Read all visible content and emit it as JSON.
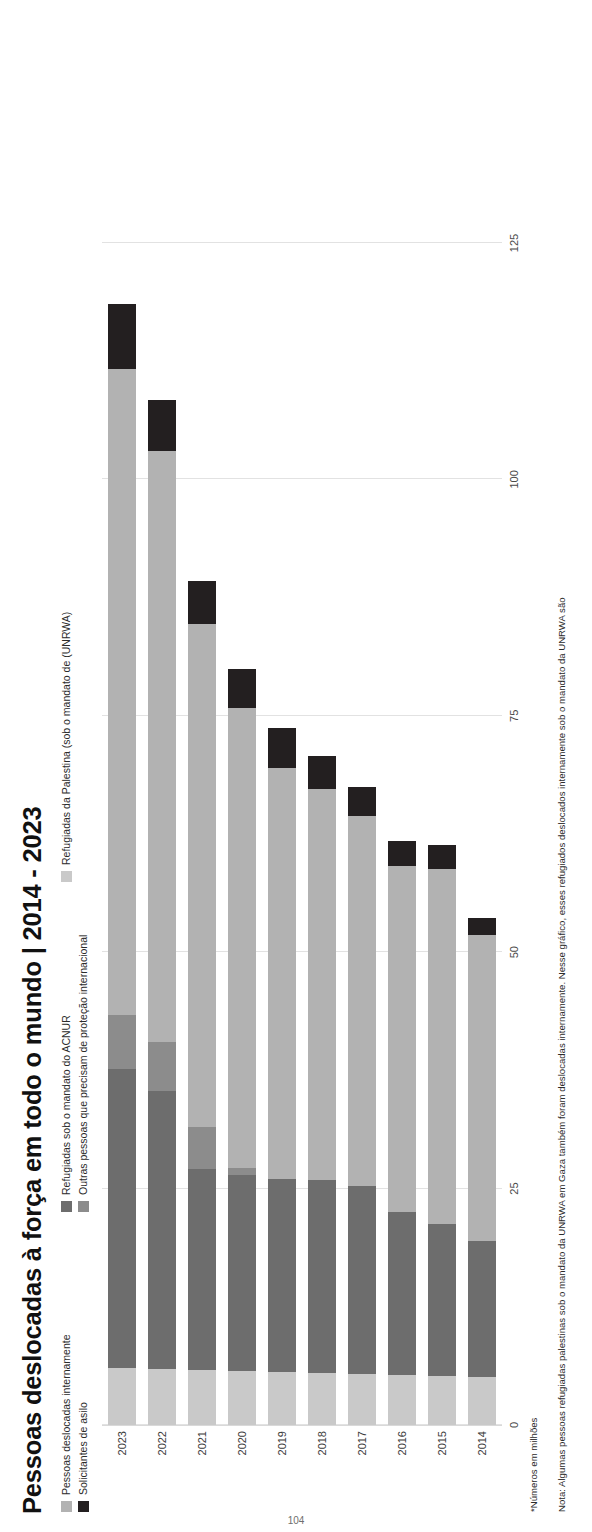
{
  "title": "Pessoas deslocadas à força em todo o mundo | 2014 - 2023",
  "legend": {
    "items": [
      {
        "label": "Pessoas deslocadas internamente",
        "color": "#b2b2b2"
      },
      {
        "label": "Solicitantes de asilo",
        "color": "#231f20"
      },
      {
        "label": "Refugiadas sob o mandato do ACNUR",
        "color": "#6d6d6d"
      },
      {
        "label": "Outras pessoas que precisam de proteção internacional",
        "color": "#8c8c8c"
      },
      {
        "label": "Refugiadas da Palestina (sob o mandato de (UNRWA)",
        "color": "#c9c9c9"
      }
    ]
  },
  "footnotes": {
    "units": "*Números em milhões",
    "note": "Nota: Algumas pessoas refugiadas palestinas sob o mandato da UNRWA em Gaza também foram deslocadas internamente. Nesse gráfico, esses refugiados deslocados internamente sob o mandato da UNRWA são"
  },
  "page_number": "104",
  "chart_data": {
    "type": "bar",
    "orientation": "horizontal-stacked",
    "title": "Pessoas deslocadas à força em todo o mundo | 2014 - 2023",
    "xlabel": "",
    "ylabel": "",
    "units": "milhões",
    "xlim": [
      0,
      125
    ],
    "xticks": [
      0,
      25,
      50,
      75,
      100,
      125
    ],
    "xtick_labels": [
      "0",
      "25",
      "50",
      "75",
      "100",
      "125"
    ],
    "grid": true,
    "legend_position": "top",
    "categories": [
      "2014",
      "2015",
      "2016",
      "2017",
      "2018",
      "2019",
      "2020",
      "2021",
      "2022",
      "2023"
    ],
    "series": [
      {
        "name": "Refugiadas da Palestina (sob o mandato de (UNRWA)",
        "color": "#c9c9c9",
        "values": [
          5.1,
          5.2,
          5.3,
          5.4,
          5.5,
          5.6,
          5.7,
          5.8,
          5.9,
          6.0
        ]
      },
      {
        "name": "Refugiadas sob o mandato do ACNUR",
        "color": "#6d6d6d",
        "values": [
          14.4,
          16.1,
          17.2,
          19.9,
          20.4,
          20.4,
          20.7,
          21.3,
          29.4,
          31.6
        ]
      },
      {
        "name": "Outras pessoas que precisam de proteção internacional",
        "color": "#8c8c8c",
        "values": [
          0,
          0,
          0,
          0,
          0,
          0,
          0.8,
          4.4,
          5.2,
          5.8
        ]
      },
      {
        "name": "Pessoas deslocadas internamente",
        "color": "#b2b2b2",
        "values": [
          32.3,
          37.5,
          36.6,
          39.1,
          41.4,
          43.5,
          48.6,
          53.2,
          62.5,
          68.3
        ]
      },
      {
        "name": "Solicitantes de asilo",
        "color": "#231f20",
        "values": [
          1.8,
          2.5,
          2.7,
          3.1,
          3.5,
          4.2,
          4.1,
          4.6,
          5.4,
          6.9
        ]
      }
    ],
    "totals": [
      59.5,
      65.3,
      65.6,
      68.5,
      70.8,
      79.5,
      82.4,
      89.3,
      108.4,
      117.3
    ],
    "stack_order_from_axis": [
      "Refugiadas da Palestina (sob o mandato de (UNRWA)",
      "Refugiadas sob o mandato do ACNUR",
      "Outras pessoas que precisam de proteção internacional",
      "Pessoas deslocadas internamente",
      "Solicitantes de asilo"
    ]
  }
}
